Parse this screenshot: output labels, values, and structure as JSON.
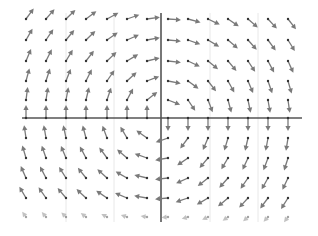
{
  "diagram": {
    "type": "vector-field",
    "field": {
      "fx": "y",
      "fy": "-x"
    },
    "colors": {
      "arrow": "#7a7a7a",
      "tail_dot": "#333333",
      "axis": "#555555",
      "grid": "#e2e2e2",
      "background": "#ffffff"
    },
    "origin_px": {
      "x": 161,
      "y": 118
    },
    "axes": {
      "x_axis": {
        "x1": 22,
        "x2": 302,
        "y": 118
      },
      "y_axis": {
        "y1": 13,
        "y2": 222,
        "x": 161
      }
    },
    "grid_lines_x": [
      66,
      114,
      210,
      258
    ],
    "samples": {
      "columns_px": [
        26,
        46,
        66,
        86,
        107,
        127,
        147,
        168,
        188,
        208,
        228,
        248,
        268,
        288
      ],
      "rows_px": [
        19,
        40,
        61,
        81,
        100,
        118,
        138,
        158,
        178,
        198,
        217
      ],
      "arrow_length_px": 13
    }
  }
}
